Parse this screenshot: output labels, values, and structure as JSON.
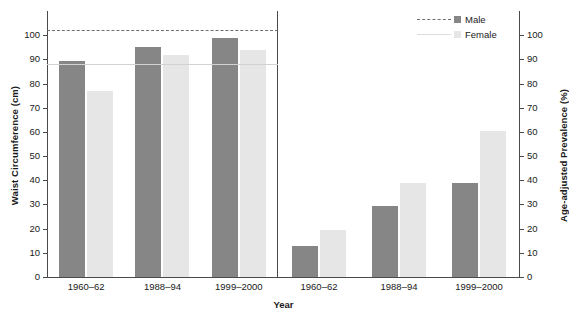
{
  "chart_data": {
    "type": "bar",
    "title": "",
    "xlabel": "Year",
    "categories": [
      "1960–62",
      "1988–94",
      "1999–2000"
    ],
    "legend": {
      "position": "top-right",
      "entries": [
        {
          "name": "Male",
          "label": "Male",
          "color": "#868686",
          "line_style": "dashed",
          "line_color": "#6e6e6e"
        },
        {
          "name": "Female",
          "label": "Female",
          "color": "#e6e6e6",
          "line_style": "solid",
          "line_color": "#dcdcdc"
        }
      ]
    },
    "panels": [
      {
        "id": "waist-circumference",
        "ylabel": "Waist Circumference (cm)",
        "ylim": [
          0,
          110
        ],
        "yticks": [
          0,
          10,
          20,
          30,
          40,
          50,
          60,
          70,
          80,
          90,
          100
        ],
        "yticklabels": [
          "0",
          "10",
          "20",
          "30",
          "40",
          "50",
          "60",
          "70",
          "80",
          "90",
          "100"
        ],
        "grid": false,
        "series": [
          {
            "name": "Male",
            "values": [
              89.5,
              95.0,
              99.0
            ]
          },
          {
            "name": "Female",
            "values": [
              77.0,
              92.0,
              94.0
            ]
          }
        ],
        "reference_lines": [
          {
            "name": "Male",
            "value": 102,
            "style": "dashed",
            "color": "#6e6e6e"
          },
          {
            "name": "Female",
            "value": 88,
            "style": "solid",
            "color": "#d2d2d2"
          }
        ]
      },
      {
        "id": "age-adjusted-prevalence",
        "ylabel": "Age-adjusted Prevalence (%)",
        "ylim": [
          0,
          110
        ],
        "yticks": [
          0,
          10,
          20,
          30,
          40,
          50,
          60,
          70,
          80,
          90,
          100
        ],
        "yticklabels": [
          "0",
          "10",
          "20",
          "30",
          "40",
          "50",
          "60",
          "70",
          "80",
          "90",
          "100"
        ],
        "grid": false,
        "series": [
          {
            "name": "Male",
            "values": [
              13.0,
              29.5,
              39.0
            ]
          },
          {
            "name": "Female",
            "values": [
              19.5,
              39.0,
              60.5
            ]
          }
        ],
        "reference_lines": []
      }
    ]
  },
  "axes": {
    "left": {
      "title": "Waist Circumference (cm)",
      "ticklabels": [
        "0",
        "10",
        "20",
        "30",
        "40",
        "50",
        "60",
        "70",
        "80",
        "90",
        "100"
      ]
    },
    "right": {
      "title": "Age-adjusted Prevalence (%)",
      "ticklabels": [
        "0",
        "10",
        "20",
        "30",
        "40",
        "50",
        "60",
        "70",
        "80",
        "90",
        "100"
      ]
    },
    "x": {
      "title": "Year",
      "ticklabels_left": [
        "1960–62",
        "1988–94",
        "1999–2000"
      ],
      "ticklabels_right": [
        "1960–62",
        "1988–94",
        "1999–2000"
      ]
    }
  }
}
